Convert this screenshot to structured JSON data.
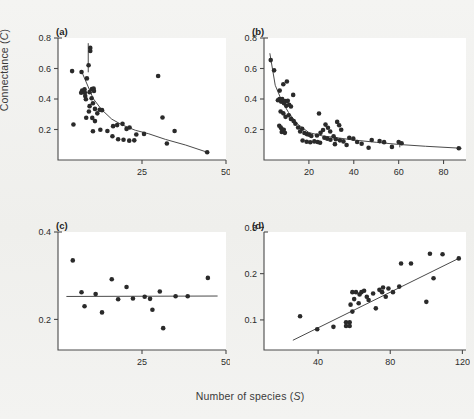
{
  "figure": {
    "axis_title_y": "Connectance (C)",
    "axis_title_y_main": "Connectance (",
    "axis_title_y_italic": "C",
    "axis_title_y_tail": ")",
    "axis_title_x_main": "Number of species (",
    "axis_title_x_italic": "S",
    "axis_title_x_tail": ")",
    "background_color": "#f2f2f0",
    "plot_background_color": "#ffffff",
    "point_color": "#2a2a2a",
    "line_color": "#4a4a4a"
  },
  "panels": {
    "a": {
      "label": "(a)"
    },
    "b": {
      "label": "(b)"
    },
    "c": {
      "label": "(c)"
    },
    "d": {
      "label": "(d)"
    }
  },
  "chart_data": [
    {
      "type": "scatter",
      "panel": "(a)",
      "title": "",
      "xlabel": "Number of species (S)",
      "ylabel": "Connectance (C)",
      "xlim": [
        0,
        50
      ],
      "ylim": [
        0,
        0.8
      ],
      "xticks": [
        25,
        50
      ],
      "yticks": [
        0.2,
        0.4,
        0.6,
        0.8
      ],
      "xticklabels": [
        "25",
        "50"
      ],
      "yticklabels": [
        "0.2",
        "0.4",
        "0.6",
        "0.8"
      ],
      "grid": false,
      "legend": false,
      "points": [
        [
          4.2,
          0.583
        ],
        [
          7.0,
          0.577
        ],
        [
          9.6,
          0.735
        ],
        [
          9.6,
          0.715
        ],
        [
          9.1,
          0.621
        ],
        [
          8.6,
          0.535
        ],
        [
          7.2,
          0.455
        ],
        [
          6.9,
          0.441
        ],
        [
          7.9,
          0.463
        ],
        [
          8.0,
          0.441
        ],
        [
          8.1,
          0.419
        ],
        [
          8.3,
          0.398
        ],
        [
          9.4,
          0.445
        ],
        [
          10.1,
          0.466
        ],
        [
          10.6,
          0.468
        ],
        [
          10.7,
          0.452
        ],
        [
          10.0,
          0.405
        ],
        [
          10.4,
          0.372
        ],
        [
          9.4,
          0.353
        ],
        [
          11.0,
          0.335
        ],
        [
          9.2,
          0.318
        ],
        [
          11.7,
          0.306
        ],
        [
          12.4,
          0.33
        ],
        [
          13.1,
          0.327
        ],
        [
          8.4,
          0.277
        ],
        [
          10.2,
          0.276
        ],
        [
          11.0,
          0.255
        ],
        [
          4.6,
          0.233
        ],
        [
          10.4,
          0.189
        ],
        [
          12.6,
          0.198
        ],
        [
          14.7,
          0.19
        ],
        [
          16.4,
          0.222
        ],
        [
          17.6,
          0.229
        ],
        [
          19.2,
          0.237
        ],
        [
          20.4,
          0.204
        ],
        [
          21.3,
          0.213
        ],
        [
          16.2,
          0.156
        ],
        [
          17.9,
          0.136
        ],
        [
          19.5,
          0.133
        ],
        [
          21.2,
          0.127
        ],
        [
          22.7,
          0.129
        ],
        [
          23.3,
          0.167
        ],
        [
          25.6,
          0.171
        ],
        [
          29.8,
          0.551
        ],
        [
          31.1,
          0.279
        ],
        [
          34.7,
          0.19
        ],
        [
          32.4,
          0.108
        ],
        [
          44.4,
          0.051
        ]
      ],
      "fitted_curve": [
        [
          7.1,
          0.577
        ],
        [
          10.5,
          0.402
        ],
        [
          13.0,
          0.33
        ],
        [
          16.0,
          0.268
        ],
        [
          19.0,
          0.231
        ],
        [
          23.0,
          0.195
        ],
        [
          27.0,
          0.172
        ],
        [
          32.0,
          0.135
        ],
        [
          38.0,
          0.098
        ],
        [
          44.4,
          0.051
        ]
      ],
      "vertical_segment": {
        "x": 9.0,
        "y0": 0.766,
        "y1": 0.575
      }
    },
    {
      "type": "scatter",
      "panel": "(b)",
      "title": "",
      "xlabel": "Number of species (S)",
      "ylabel": "Connectance (C)",
      "xlim": [
        0,
        90
      ],
      "ylim": [
        0,
        0.8
      ],
      "xticks": [
        20,
        40,
        60,
        80
      ],
      "yticks": [
        0.2,
        0.4,
        0.6,
        0.8
      ],
      "xticklabels": [
        "20",
        "40",
        "60",
        "80"
      ],
      "yticklabels": [
        "0.2",
        "0.4",
        "0.6",
        "0.8"
      ],
      "grid": false,
      "legend": false,
      "points": [
        [
          3.0,
          0.655
        ],
        [
          4.5,
          0.588
        ],
        [
          8.6,
          0.497
        ],
        [
          10.2,
          0.515
        ],
        [
          7.0,
          0.455
        ],
        [
          6.2,
          0.392
        ],
        [
          6.9,
          0.4
        ],
        [
          7.6,
          0.383
        ],
        [
          8.1,
          0.399
        ],
        [
          8.9,
          0.372
        ],
        [
          9.4,
          0.386
        ],
        [
          9.9,
          0.355
        ],
        [
          10.6,
          0.388
        ],
        [
          11.2,
          0.362
        ],
        [
          12.0,
          0.351
        ],
        [
          13.0,
          0.427
        ],
        [
          7.4,
          0.318
        ],
        [
          8.6,
          0.306
        ],
        [
          9.6,
          0.283
        ],
        [
          11.0,
          0.293
        ],
        [
          12.0,
          0.269
        ],
        [
          13.2,
          0.255
        ],
        [
          6.8,
          0.225
        ],
        [
          7.5,
          0.212
        ],
        [
          8.1,
          0.2
        ],
        [
          7.9,
          0.184
        ],
        [
          8.8,
          0.198
        ],
        [
          9.3,
          0.178
        ],
        [
          14.0,
          0.238
        ],
        [
          15.2,
          0.213
        ],
        [
          16.1,
          0.187
        ],
        [
          17.0,
          0.205
        ],
        [
          18.0,
          0.177
        ],
        [
          19.1,
          0.17
        ],
        [
          20.1,
          0.166
        ],
        [
          21.1,
          0.157
        ],
        [
          17.2,
          0.128
        ],
        [
          19.0,
          0.12
        ],
        [
          20.6,
          0.116
        ],
        [
          22.4,
          0.122
        ],
        [
          23.9,
          0.118
        ],
        [
          25.0,
          0.113
        ],
        [
          23.6,
          0.161
        ],
        [
          25.2,
          0.178
        ],
        [
          26.3,
          0.197
        ],
        [
          24.5,
          0.305
        ],
        [
          27.4,
          0.232
        ],
        [
          28.5,
          0.211
        ],
        [
          29.5,
          0.187
        ],
        [
          26.9,
          0.146
        ],
        [
          28.2,
          0.14
        ],
        [
          29.6,
          0.133
        ],
        [
          31.0,
          0.155
        ],
        [
          32.6,
          0.25
        ],
        [
          33.5,
          0.228
        ],
        [
          34.4,
          0.198
        ],
        [
          32.0,
          0.136
        ],
        [
          33.8,
          0.129
        ],
        [
          35.4,
          0.122
        ],
        [
          36.8,
          0.098
        ],
        [
          31.6,
          0.104
        ],
        [
          38.0,
          0.146
        ],
        [
          39.8,
          0.14
        ],
        [
          41.5,
          0.118
        ],
        [
          43.5,
          0.107
        ],
        [
          46.6,
          0.08
        ],
        [
          48.0,
          0.131
        ],
        [
          51.5,
          0.124
        ],
        [
          53.5,
          0.117
        ],
        [
          57.0,
          0.086
        ],
        [
          60.0,
          0.118
        ],
        [
          61.3,
          0.11
        ],
        [
          86.8,
          0.077
        ]
      ],
      "fitted_curve": [
        [
          2.6,
          0.7
        ],
        [
          5.0,
          0.49
        ],
        [
          8.0,
          0.385
        ],
        [
          11.0,
          0.31
        ],
        [
          15.0,
          0.235
        ],
        [
          20.0,
          0.18
        ],
        [
          26.0,
          0.158
        ],
        [
          32.0,
          0.147
        ],
        [
          40.0,
          0.131
        ],
        [
          50.0,
          0.116
        ],
        [
          60.0,
          0.102
        ],
        [
          72.0,
          0.09
        ],
        [
          88.0,
          0.077
        ]
      ],
      "vertical_segment": {
        "x": 60.5,
        "y0": 0.112,
        "y1": 0.083
      }
    },
    {
      "type": "scatter",
      "panel": "(c)",
      "title": "",
      "xlabel": "Number of species (S)",
      "ylabel": "Connectance (C)",
      "xlim": [
        0,
        50
      ],
      "ylim": [
        0.13,
        0.4
      ],
      "xticks": [
        25,
        50
      ],
      "yticks": [
        0.2,
        0.4
      ],
      "xticklabels": [
        "25",
        "50"
      ],
      "yticklabels": [
        "0.2",
        "0.4"
      ],
      "grid": false,
      "legend": false,
      "points": [
        [
          4.4,
          0.335
        ],
        [
          7.0,
          0.262
        ],
        [
          7.9,
          0.23
        ],
        [
          11.2,
          0.258
        ],
        [
          13.1,
          0.216
        ],
        [
          16.0,
          0.292
        ],
        [
          17.9,
          0.246
        ],
        [
          20.4,
          0.274
        ],
        [
          22.3,
          0.248
        ],
        [
          25.8,
          0.252
        ],
        [
          27.4,
          0.247
        ],
        [
          28.1,
          0.222
        ],
        [
          30.3,
          0.264
        ],
        [
          31.3,
          0.18
        ],
        [
          35.0,
          0.253
        ],
        [
          38.6,
          0.253
        ],
        [
          44.6,
          0.295
        ]
      ],
      "fitted_line": [
        [
          2.5,
          0.2525
        ],
        [
          47.5,
          0.2535
        ]
      ]
    },
    {
      "type": "scatter",
      "panel": "(d)",
      "title": "",
      "xlabel": "Number of species (S)",
      "ylabel": "Connectance (C)",
      "xlim": [
        10,
        122
      ],
      "ylim": [
        0.035,
        0.29
      ],
      "xticks": [
        40,
        80,
        120
      ],
      "yticks": [
        0.1,
        0.2,
        0.3
      ],
      "xticklabels": [
        "40",
        "80",
        "120"
      ],
      "yticklabels": [
        "0.1",
        "0.2",
        "0.3"
      ],
      "grid": false,
      "legend": false,
      "points": [
        [
          30.0,
          0.108
        ],
        [
          39.5,
          0.08
        ],
        [
          48.5,
          0.085
        ],
        [
          55.5,
          0.095
        ],
        [
          55.5,
          0.087
        ],
        [
          57.5,
          0.095
        ],
        [
          57.5,
          0.087
        ],
        [
          59.0,
          0.118
        ],
        [
          58.0,
          0.133
        ],
        [
          60.0,
          0.145
        ],
        [
          62.5,
          0.136
        ],
        [
          63.0,
          0.155
        ],
        [
          64.0,
          0.16
        ],
        [
          65.5,
          0.163
        ],
        [
          61.0,
          0.16
        ],
        [
          59.0,
          0.16
        ],
        [
          67.0,
          0.15
        ],
        [
          68.0,
          0.143
        ],
        [
          70.5,
          0.157
        ],
        [
          72.0,
          0.125
        ],
        [
          74.0,
          0.165
        ],
        [
          75.5,
          0.16
        ],
        [
          76.0,
          0.17
        ],
        [
          77.5,
          0.15
        ],
        [
          79.0,
          0.168
        ],
        [
          81.5,
          0.16
        ],
        [
          85.0,
          0.172
        ],
        [
          86.0,
          0.222
        ],
        [
          91.5,
          0.222
        ],
        [
          100.0,
          0.139
        ],
        [
          102.0,
          0.243
        ],
        [
          104.0,
          0.19
        ],
        [
          109.0,
          0.242
        ],
        [
          118.0,
          0.233
        ]
      ],
      "fitted_line": [
        [
          26.0,
          0.056
        ],
        [
          118.5,
          0.234
        ]
      ]
    }
  ]
}
